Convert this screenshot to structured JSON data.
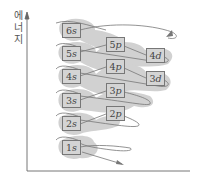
{
  "axis": {
    "y_label_chars": [
      "에",
      "너",
      "지"
    ],
    "y_label": "에너지"
  },
  "orbitals": [
    {
      "id": "1s",
      "n": "1",
      "l": "s",
      "x": 62,
      "y": 140
    },
    {
      "id": "2s",
      "n": "2",
      "l": "s",
      "x": 62,
      "y": 116
    },
    {
      "id": "2p",
      "n": "2",
      "l": "p",
      "x": 106,
      "y": 106
    },
    {
      "id": "3s",
      "n": "3",
      "l": "s",
      "x": 62,
      "y": 93
    },
    {
      "id": "3p",
      "n": "3",
      "l": "p",
      "x": 106,
      "y": 83
    },
    {
      "id": "4s",
      "n": "4",
      "l": "s",
      "x": 62,
      "y": 69
    },
    {
      "id": "3d",
      "n": "3",
      "l": "d",
      "x": 146,
      "y": 71
    },
    {
      "id": "4p",
      "n": "4",
      "l": "p",
      "x": 106,
      "y": 59
    },
    {
      "id": "5s",
      "n": "5",
      "l": "s",
      "x": 62,
      "y": 46
    },
    {
      "id": "4d",
      "n": "4",
      "l": "d",
      "x": 146,
      "y": 48
    },
    {
      "id": "5p",
      "n": "5",
      "l": "p",
      "x": 106,
      "y": 37
    },
    {
      "id": "6s",
      "n": "6",
      "l": "s",
      "x": 62,
      "y": 23
    }
  ],
  "filling_order": [
    "1s",
    "2s",
    "2p",
    "3s",
    "3p",
    "4s",
    "3d",
    "4p",
    "5s",
    "4d",
    "5p",
    "6s"
  ],
  "colors": {
    "axis": "#666666",
    "path": "#777777",
    "shade": "#cfcfcf",
    "box_fill": "#d4d4d4",
    "box_border": "#777777"
  }
}
